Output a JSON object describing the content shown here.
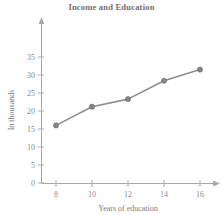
{
  "chart_data": {
    "type": "line",
    "title": "Income and Education",
    "xlabel": "Years of education",
    "ylabel": "In thousands",
    "x": [
      8,
      10,
      12,
      14,
      16
    ],
    "values": [
      16.0,
      21.2,
      23.3,
      28.4,
      31.5
    ],
    "series": [
      {
        "name": "Income",
        "values": [
          16.0,
          21.2,
          23.3,
          28.4,
          31.5
        ]
      }
    ],
    "xticks": [
      8,
      10,
      12,
      14,
      16
    ],
    "xtick_labels": [
      "8",
      "10",
      "12",
      "14",
      "16"
    ],
    "yticks": [
      0,
      5,
      10,
      15,
      20,
      25,
      30,
      35
    ],
    "ytick_labels": [
      "0",
      "5",
      "10",
      "15",
      "20",
      "25",
      "30",
      "35"
    ],
    "xlim": [
      7,
      17
    ],
    "ylim": [
      0,
      37
    ],
    "grid": false,
    "legend": false,
    "legend_position": "none",
    "marker": "circle",
    "line_color": "#8d8d8d",
    "marker_color": "#848484",
    "axis_color": "#a8a8a8",
    "text_color": "#7d7d7d",
    "title_color": "#6e6e6e",
    "background_color": "#ffffff"
  }
}
